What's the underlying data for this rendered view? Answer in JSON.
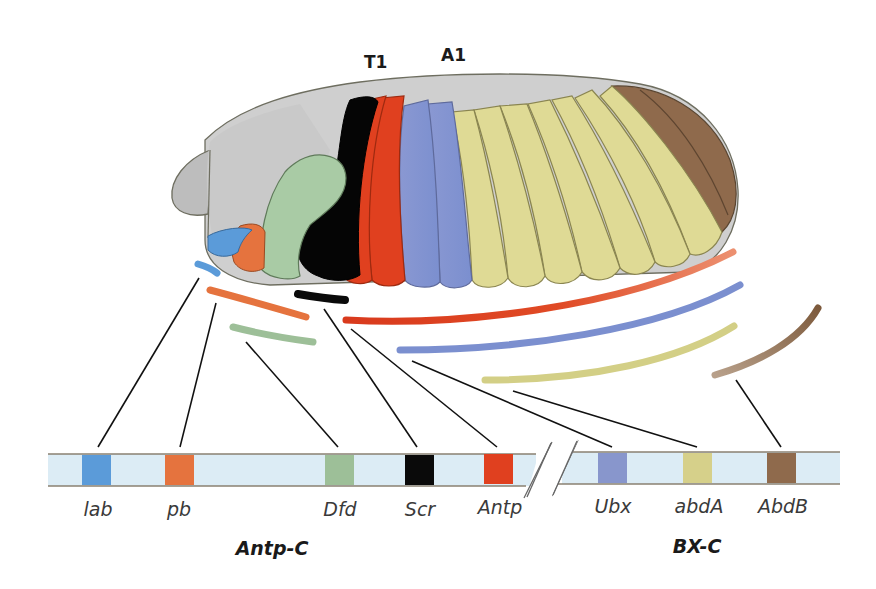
{
  "figure": {
    "segment_labels": [
      {
        "id": "T1",
        "text": "T1",
        "x": 364,
        "y": 52
      },
      {
        "id": "A1",
        "text": "A1",
        "x": 441,
        "y": 45
      }
    ],
    "genes": [
      {
        "name": "lab",
        "color": "#5b9bd9",
        "box_x": 82,
        "label_x": 98
      },
      {
        "name": "pb",
        "color": "#e5733e",
        "box_x": 165,
        "label_x": 179
      },
      {
        "name": "Dfd",
        "color": "#9dbf98",
        "box_x": 325,
        "label_x": 340
      },
      {
        "name": "Scr",
        "color": "#0a0a0a",
        "box_x": 405,
        "label_x": 420
      },
      {
        "name": "Antp",
        "color": "#e0401f",
        "box_x": 484,
        "label_x": 500
      },
      {
        "name": "Ubx",
        "color": "#8896cc",
        "box_x": 598,
        "label_x": 613
      },
      {
        "name": "abdA",
        "color": "#d6d08a",
        "box_x": 683,
        "label_x": 699
      },
      {
        "name": "AbdB",
        "color": "#8f6a4c",
        "box_x": 767,
        "label_x": 783
      }
    ],
    "clusters": [
      {
        "name": "Antp-C",
        "x": 272,
        "y": 538
      },
      {
        "name": "BX-C",
        "x": 697,
        "y": 538
      }
    ],
    "chromosome": {
      "fill": "#dcecf5",
      "border": "#8a8070",
      "break_symbol": "//"
    },
    "embryo_colors": {
      "head": "#c8c8c8",
      "lab": "#5b9bd9",
      "pb": "#e5733e",
      "Dfd": "#a9cba5",
      "Scr": "#050505",
      "Antp": "#e0401f",
      "Ubx": "#8c9ad0",
      "abdA": "#dfda95",
      "AbdB": "#8f6a4c"
    }
  }
}
